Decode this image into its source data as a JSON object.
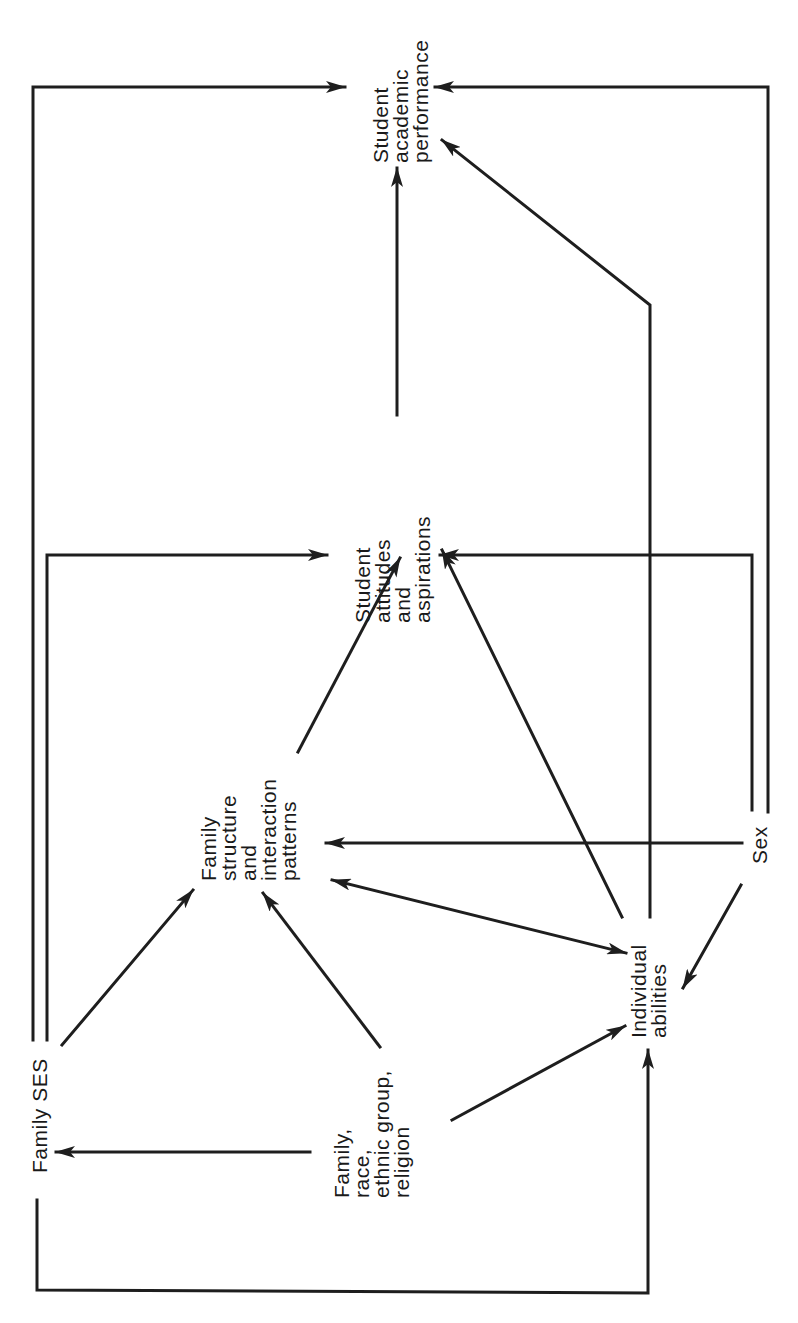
{
  "diagram": {
    "orientation": "rotated -90deg (text reads bottom-to-top)",
    "nodes": {
      "family_ses": {
        "lines": [
          "Family SES"
        ]
      },
      "family_race": {
        "lines": [
          "Family,",
          "race,",
          "ethnic group,",
          "religion"
        ]
      },
      "family_structure": {
        "lines": [
          "Family",
          "structure",
          "and",
          "interaction",
          "patterns"
        ]
      },
      "individual_abilities": {
        "lines": [
          "Individual",
          "abilities"
        ]
      },
      "sex": {
        "lines": [
          "Sex"
        ]
      },
      "student_attitudes": {
        "lines": [
          "Student",
          "attitudes",
          "and",
          "aspirations"
        ]
      },
      "student_performance": {
        "lines": [
          "Student",
          "academic",
          "performance"
        ]
      }
    },
    "edges": [
      {
        "from": "Family SES",
        "to": "Student academic performance"
      },
      {
        "from": "Family SES",
        "to": "Student attitudes and aspirations"
      },
      {
        "from": "Family SES",
        "to": "Family structure and interaction patterns"
      },
      {
        "from": "Family SES",
        "to": "Individual abilities"
      },
      {
        "from": "Family, race, ethnic group, religion",
        "to": "Family SES"
      },
      {
        "from": "Family, race, ethnic group, religion",
        "to": "Family structure and interaction patterns"
      },
      {
        "from": "Family, race, ethnic group, religion",
        "to": "Individual abilities"
      },
      {
        "from": "Family structure and interaction patterns",
        "to": "Student attitudes and aspirations"
      },
      {
        "from": "Family structure and interaction patterns",
        "to": "Individual abilities",
        "bidirectional": true
      },
      {
        "from": "Sex",
        "to": "Family structure and interaction patterns"
      },
      {
        "from": "Sex",
        "to": "Individual abilities"
      },
      {
        "from": "Sex",
        "to": "Student attitudes and aspirations"
      },
      {
        "from": "Sex",
        "to": "Student academic performance"
      },
      {
        "from": "Individual abilities",
        "to": "Student attitudes and aspirations"
      },
      {
        "from": "Individual abilities",
        "to": "Student academic performance"
      },
      {
        "from": "Student attitudes and aspirations",
        "to": "Student academic performance"
      }
    ]
  }
}
